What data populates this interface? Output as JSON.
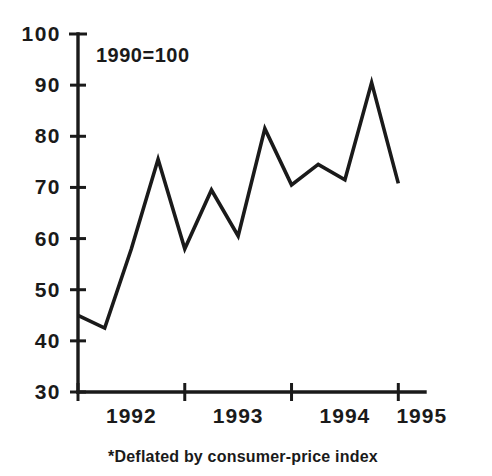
{
  "chart_data": {
    "type": "line",
    "title": "",
    "subtitle": "",
    "annotation": "1990=100",
    "footnote": "*Deflated by consumer-price index",
    "xlabel": "",
    "ylabel": "",
    "ylim": [
      30,
      100
    ],
    "xlim": [
      1991.5,
      1994.75
    ],
    "grid": false,
    "legend": false,
    "y_ticks": [
      30,
      40,
      50,
      60,
      70,
      80,
      90,
      100
    ],
    "y_tick_labels": [
      "30",
      "40",
      "50",
      "60",
      "70",
      "80",
      "90",
      "100"
    ],
    "x_tick_values": [
      1991.5,
      1992.5,
      1993.5,
      1994.5
    ],
    "x_axis_labels": [
      "1992",
      "1993",
      "1994",
      "1995"
    ],
    "x_label_positions": [
      1992.0,
      1993.0,
      1994.0,
      1994.72
    ],
    "series": [
      {
        "name": "index",
        "x": [
          1991.5,
          1991.75,
          1992.0,
          1992.25,
          1992.5,
          1992.75,
          1993.0,
          1993.25,
          1993.5,
          1993.75,
          1994.0,
          1994.25,
          1994.5
        ],
        "values": [
          45.0,
          42.5,
          58.0,
          75.5,
          58.0,
          69.5,
          60.5,
          81.5,
          70.5,
          74.5,
          71.5,
          90.5,
          70.8
        ]
      }
    ]
  }
}
